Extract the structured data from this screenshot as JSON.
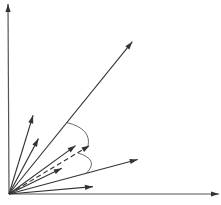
{
  "diagram": {
    "origin": [
      0,
      0
    ],
    "axes": [
      {
        "name": "x-axis",
        "direction_deg": 0
      },
      {
        "name": "y-axis",
        "direction_deg": 90
      }
    ],
    "vectors": [
      {
        "name": "long-vector",
        "angle_deg": 51,
        "length": 1.0,
        "style": "solid"
      },
      {
        "name": "steep-vector",
        "angle_deg": 73,
        "length": 0.42,
        "style": "solid"
      },
      {
        "name": "steep-vector-2",
        "angle_deg": 62,
        "length": 0.32,
        "style": "solid"
      },
      {
        "name": "mid-vector",
        "angle_deg": 36,
        "length": 0.42,
        "style": "solid"
      },
      {
        "name": "dashed-vector",
        "angle_deg": 31,
        "length": 0.48,
        "style": "dashed"
      },
      {
        "name": "short-vector",
        "angle_deg": 26,
        "length": 0.3,
        "style": "solid"
      },
      {
        "name": "lower-vector",
        "angle_deg": 15,
        "length": 0.68,
        "style": "solid"
      },
      {
        "name": "flat-vector",
        "angle_deg": 5,
        "length": 0.43,
        "style": "solid"
      }
    ],
    "angle_arcs": [
      {
        "name": "arc-long-to-dashed",
        "from": "long-vector",
        "to": "dashed-vector"
      },
      {
        "name": "arc-dashed-to-lower",
        "from": "dashed-vector",
        "to": "lower-vector"
      }
    ]
  }
}
